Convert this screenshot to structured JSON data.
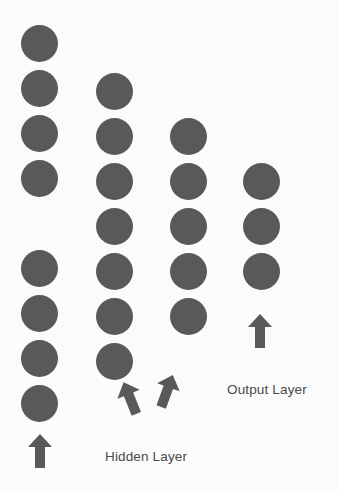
{
  "diagram": {
    "background_color": "#fbfbfb",
    "node_color": "#595959",
    "arrow_color": "#595959",
    "text_color": "#4a4a4a",
    "node_diameter": 37,
    "layers": [
      {
        "name": "input-layer",
        "label": "",
        "node_count": 8,
        "cx": 39,
        "nodes_cy": [
          43,
          88,
          133,
          178,
          268,
          313,
          358,
          403
        ]
      },
      {
        "name": "hidden-layer-1",
        "label": "",
        "node_count": 7,
        "cx": 114,
        "nodes_cy": [
          91,
          136,
          181,
          226,
          271,
          316,
          361
        ]
      },
      {
        "name": "hidden-layer-2",
        "label": "",
        "node_count": 5,
        "cx": 188,
        "nodes_cy": [
          136,
          181,
          226,
          271,
          316
        ]
      },
      {
        "name": "output-layer",
        "label": "",
        "node_count": 3,
        "cx": 261,
        "nodes_cy": [
          181,
          226,
          271
        ]
      }
    ],
    "labels": [
      {
        "name": "hidden-layer-label",
        "text": "Hidden Layer",
        "x": 105,
        "y": 450
      },
      {
        "name": "output-layer-label",
        "text": "Output Layer",
        "x": 227,
        "y": 383
      }
    ],
    "arrows": [
      {
        "name": "input-arrow",
        "x": 28,
        "y": 434,
        "rotation": 0
      },
      {
        "name": "hidden-arrow-left",
        "x": 118,
        "y": 381,
        "rotation": -22
      },
      {
        "name": "hidden-arrow-right",
        "x": 155,
        "y": 374,
        "rotation": 20
      },
      {
        "name": "output-arrow",
        "x": 248,
        "y": 314,
        "rotation": 0
      }
    ]
  }
}
